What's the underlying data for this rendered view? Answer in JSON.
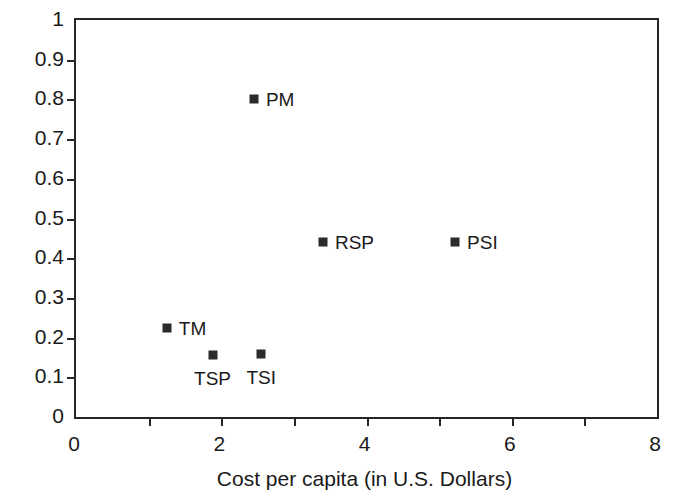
{
  "chart_data": {
    "type": "scatter",
    "title": "",
    "xlabel": "Cost per capita (in U.S. Dollars)",
    "ylabel": "",
    "xlim": [
      0,
      8
    ],
    "ylim": [
      0,
      1
    ],
    "grid": false,
    "legend": "none",
    "xticks": [
      0,
      2,
      4,
      6,
      8
    ],
    "xticklabels": [
      "0",
      "2",
      "4",
      "6",
      "8"
    ],
    "xminorticks": [
      1,
      3,
      5,
      7
    ],
    "yticks": [
      0,
      0.1,
      0.2,
      0.3,
      0.4,
      0.5,
      0.6,
      0.7,
      0.8,
      0.9,
      1
    ],
    "yticklabels": [
      "0",
      "0.1",
      "0.2",
      "0.3",
      "0.4",
      "0.5",
      "0.6",
      "0.7",
      "0.8",
      "0.9",
      "1"
    ],
    "marker": "square",
    "marker_color": "#2b2b2b",
    "points": [
      {
        "label": "PM",
        "x": 2.45,
        "y": 0.8,
        "label_pos": "right"
      },
      {
        "label": "RSP",
        "x": 3.4,
        "y": 0.44,
        "label_pos": "right"
      },
      {
        "label": "PSI",
        "x": 5.22,
        "y": 0.44,
        "label_pos": "right"
      },
      {
        "label": "TM",
        "x": 1.25,
        "y": 0.225,
        "label_pos": "right"
      },
      {
        "label": "TSP",
        "x": 1.88,
        "y": 0.155,
        "label_pos": "below"
      },
      {
        "label": "TSI",
        "x": 2.55,
        "y": 0.158,
        "label_pos": "below"
      }
    ]
  },
  "axis": {
    "frame_color": "#262626"
  }
}
